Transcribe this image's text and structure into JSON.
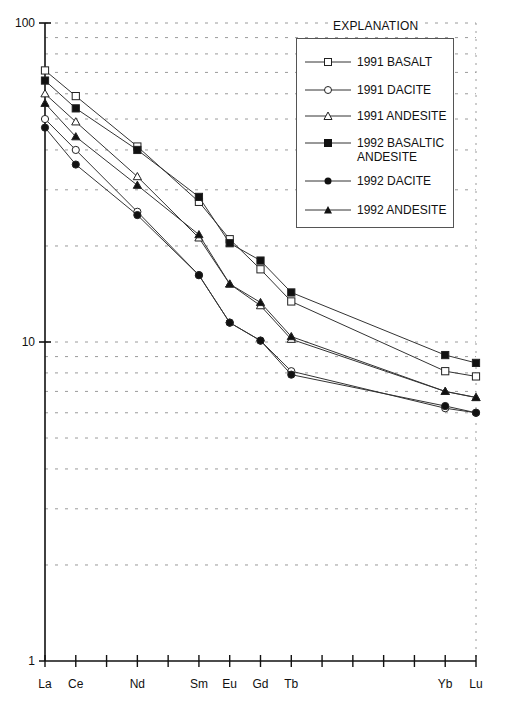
{
  "chart_data": {
    "type": "line",
    "title": "",
    "xlabel": "",
    "ylabel": "",
    "yscale": "log",
    "ylim": [
      1,
      100
    ],
    "y_ticks": [
      1,
      10,
      100
    ],
    "y_tick_labels": [
      "1",
      "10",
      "100"
    ],
    "grid": "horizontal dashed at minor log ticks (2-9 x decade)",
    "x_positions": [
      "La",
      "Ce",
      "Pr",
      "Nd",
      "Pm",
      "Sm",
      "Eu",
      "Gd",
      "Tb",
      "Dy",
      "Ho",
      "Er",
      "Tm",
      "Yb",
      "Lu"
    ],
    "categories_labeled": [
      "La",
      "Ce",
      "Nd",
      "Sm",
      "Eu",
      "Gd",
      "Tb",
      "Yb",
      "Lu"
    ],
    "legend_title": "EXPLANATION",
    "legend_position": "upper right",
    "series": [
      {
        "name": "1991 BASALT",
        "marker": "open-square",
        "values": {
          "La": 71,
          "Ce": 59,
          "Nd": 41,
          "Sm": 27.5,
          "Eu": 21,
          "Gd": 16.9,
          "Tb": 13.4,
          "Yb": 8.1,
          "Lu": 7.8
        }
      },
      {
        "name": "1991 DACITE",
        "marker": "open-circle",
        "values": {
          "La": 50,
          "Ce": 40,
          "Nd": 25.6,
          "Sm": 16.2,
          "Eu": 11.5,
          "Gd": 10.1,
          "Tb": 8.1,
          "Yb": 6.2,
          "Lu": 6.0
        }
      },
      {
        "name": "1991 ANDESITE",
        "marker": "open-triangle",
        "values": {
          "La": 60,
          "Ce": 49,
          "Nd": 33,
          "Sm": 21.2,
          "Eu": 15.2,
          "Gd": 13.0,
          "Tb": 10.2,
          "Yb": 7.0,
          "Lu": 6.7
        }
      },
      {
        "name": "1992 BASALTIC ANDESITE",
        "marker": "filled-square",
        "values": {
          "La": 66,
          "Ce": 54,
          "Nd": 40,
          "Sm": 28.5,
          "Eu": 20.4,
          "Gd": 18,
          "Tb": 14.3,
          "Yb": 9.1,
          "Lu": 8.6
        }
      },
      {
        "name": "1992 DACITE",
        "marker": "filled-circle",
        "values": {
          "La": 47,
          "Ce": 36,
          "Nd": 25,
          "Sm": 16.2,
          "Eu": 11.5,
          "Gd": 10.1,
          "Tb": 7.9,
          "Yb": 6.3,
          "Lu": 6.0
        }
      },
      {
        "name": "1992 ANDESITE",
        "marker": "filled-triangle",
        "values": {
          "La": 56,
          "Ce": 44,
          "Nd": 31,
          "Sm": 21.7,
          "Eu": 15.2,
          "Gd": 13.3,
          "Tb": 10.4,
          "Yb": 7.0,
          "Lu": 6.7
        }
      }
    ]
  },
  "legend": {
    "title": "EXPLANATION",
    "items": [
      {
        "label": "1991 BASALT"
      },
      {
        "label": "1991 DACITE"
      },
      {
        "label": "1991 ANDESITE"
      },
      {
        "label": "1992 BASALTIC\nANDESITE"
      },
      {
        "label": "1992 DACITE"
      },
      {
        "label": "1992 ANDESITE"
      }
    ]
  },
  "axes": {
    "y_labels": [
      "100",
      "10",
      "1"
    ],
    "x_labels": [
      "La",
      "Ce",
      "Nd",
      "Sm",
      "Eu",
      "Gd",
      "Tb",
      "Yb",
      "Lu"
    ]
  }
}
